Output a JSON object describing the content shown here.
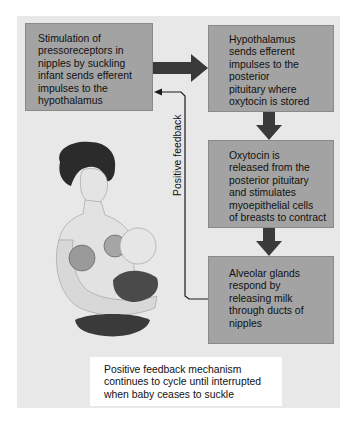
{
  "diagram": {
    "boxes": [
      {
        "id": "box1",
        "text": "Stimulation of\npressoreceptors in\nnipples by suckling\ninfant sends efferent\nimpulses to the\nhypothalamus"
      },
      {
        "id": "box2",
        "text": "Hypothalamus\nsends efferent\nimpulses to the\nposterior\npituitary where\noxytocin is stored"
      },
      {
        "id": "box3",
        "text": "Oxytocin is\nreleased from the\nposterior pituitary\nand stimulates\nmyoepithelial cells\nof breasts to contract"
      },
      {
        "id": "box4",
        "text": "Alveolar glands\nrespond by\nreleasing milk\nthrough ducts of\nnipples"
      }
    ],
    "feedback_label": "Positive feedback",
    "note": "Positive feedback mechanism\ncontinues to cycle until interrupted\nwhen baby ceases to suckle",
    "illustration": "mother breastfeeding infant",
    "colors": {
      "panel": "#e8e8e8",
      "box": "#a3a3a3",
      "arrow": "#3a3a3a",
      "line": "#1a1a1a",
      "note_bg": "#ffffff"
    }
  }
}
